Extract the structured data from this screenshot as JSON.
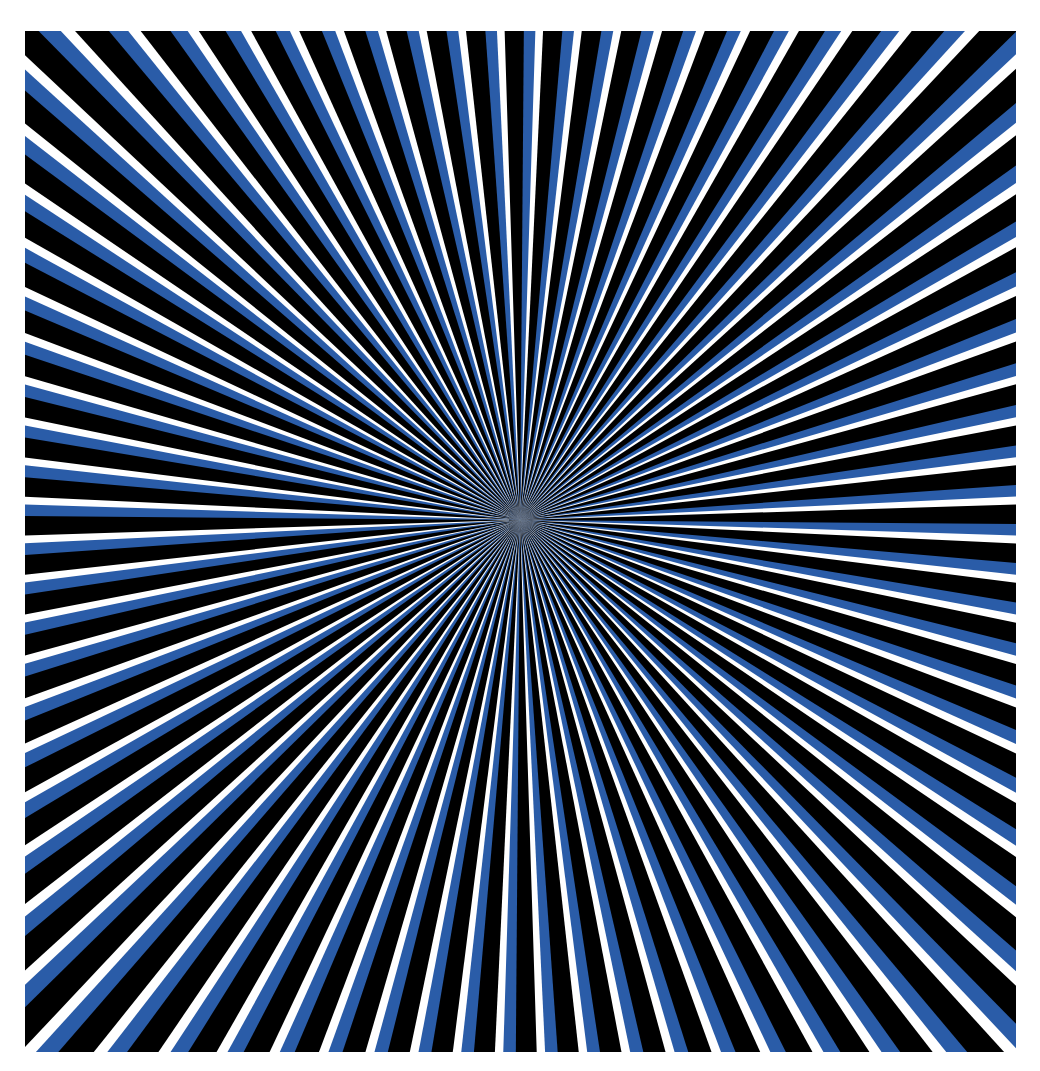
{
  "artwork": {
    "title": "Radial moiré optical illusion",
    "background": "#ffffff",
    "frame": {
      "left": 25,
      "top": 31,
      "right": 1016,
      "bottom": 1052
    },
    "center": {
      "x": 495,
      "y": 489
    },
    "colors": {
      "blue": "#2a5ca8",
      "black": "#000000",
      "white": "#ffffff"
    },
    "ray_sets": [
      {
        "color": "#2a5ca8",
        "count": 80,
        "rotation_deg": 0,
        "twist": 0.9
      },
      {
        "color": "#000000",
        "count": 80,
        "rotation_deg": 2.25,
        "twist": -0.9
      }
    ]
  }
}
